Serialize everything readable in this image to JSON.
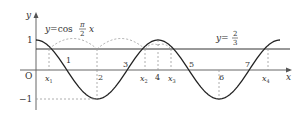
{
  "axes": {
    "x_label": "x",
    "y_label": "y",
    "origin_label": "O",
    "y_tick_pos": "1",
    "y_tick_neg": "−1"
  },
  "curve": {
    "label_prefix": "y=cos",
    "frac_num": "π",
    "frac_den": "2",
    "label_suffix": "x"
  },
  "line": {
    "label_prefix": "y=",
    "frac_num": "2",
    "frac_den": "3"
  },
  "x_ticks": [
    "1",
    "2",
    "3",
    "4",
    "5",
    "6",
    "7"
  ],
  "intersections": [
    "x",
    "x",
    "x",
    "x"
  ],
  "intersection_subs": [
    "1",
    "2",
    "3",
    "4"
  ],
  "colors": {
    "curve": "#222222",
    "axis": "#555555",
    "dashed": "#999999"
  }
}
